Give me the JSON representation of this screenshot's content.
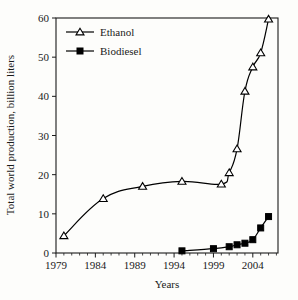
{
  "chart_data": {
    "type": "line",
    "title": "",
    "xlabel": "Years",
    "ylabel": "Total world production, billion liters",
    "xlim": [
      1979,
      2007.2
    ],
    "ylim": [
      0,
      60
    ],
    "xticks": [
      1979,
      1984,
      1989,
      1994,
      1999,
      2004
    ],
    "xtick_labels": [
      "1979",
      "1984",
      "1989",
      "1994",
      "1999",
      "2004"
    ],
    "yticks": [
      0,
      10,
      20,
      30,
      40,
      50,
      60
    ],
    "ytick_labels": [
      "0",
      "10",
      "20",
      "30",
      "40",
      "50",
      "60"
    ],
    "x_minor_tick_interval": 1,
    "grid": false,
    "legend_position": "top-left",
    "series": [
      {
        "name": "Ethanol",
        "marker": "open-triangle",
        "color": "#000000",
        "points": [
          {
            "x": 1980,
            "y": 4.4
          },
          {
            "x": 1985,
            "y": 13.9
          },
          {
            "x": 1990,
            "y": 17.0
          },
          {
            "x": 1995,
            "y": 18.3
          },
          {
            "x": 2000,
            "y": 17.6
          },
          {
            "x": 2001,
            "y": 20.5
          },
          {
            "x": 2002,
            "y": 26.6
          },
          {
            "x": 2003,
            "y": 41.3
          },
          {
            "x": 2004,
            "y": 47.5
          },
          {
            "x": 2005,
            "y": 51.1
          },
          {
            "x": 2006,
            "y": 59.7
          }
        ]
      },
      {
        "name": "Biodiesel",
        "marker": "filled-square",
        "color": "#000000",
        "points": [
          {
            "x": 1995,
            "y": 0.55
          },
          {
            "x": 1999,
            "y": 1.1
          },
          {
            "x": 2001,
            "y": 1.6
          },
          {
            "x": 2002,
            "y": 2.1
          },
          {
            "x": 2003,
            "y": 2.5
          },
          {
            "x": 2004,
            "y": 3.4
          },
          {
            "x": 2005,
            "y": 6.4
          },
          {
            "x": 2006,
            "y": 9.3
          }
        ]
      }
    ]
  },
  "legend": {
    "entries": [
      {
        "label": "Ethanol"
      },
      {
        "label": "Biodiesel"
      }
    ]
  },
  "axes": {
    "y_title": "Total world production, billion liters",
    "x_title": "Years"
  }
}
